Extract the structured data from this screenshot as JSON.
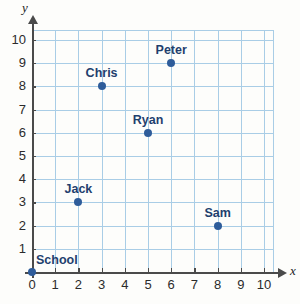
{
  "chart_data": {
    "type": "scatter",
    "title": "",
    "xlabel": "x",
    "ylabel": "y",
    "xlim": [
      0,
      10
    ],
    "ylim": [
      0,
      10
    ],
    "grid": true,
    "legend": "none",
    "x_ticks": [
      "0",
      "1",
      "2",
      "3",
      "4",
      "5",
      "6",
      "7",
      "8",
      "9",
      "10"
    ],
    "y_ticks": [
      "1",
      "2",
      "3",
      "4",
      "5",
      "6",
      "7",
      "8",
      "9",
      "10"
    ],
    "point_color": "#2e5c9a",
    "label_color": "#1f3f6e",
    "grid_color": "#a9cde6",
    "axis_color": "#4a4a4a",
    "points": [
      {
        "name": "School",
        "x": 0,
        "y": 0,
        "label_pos": "right-above"
      },
      {
        "name": "Jack",
        "x": 2,
        "y": 3,
        "label_pos": "above"
      },
      {
        "name": "Chris",
        "x": 3,
        "y": 8,
        "label_pos": "above"
      },
      {
        "name": "Ryan",
        "x": 5,
        "y": 6,
        "label_pos": "above"
      },
      {
        "name": "Peter",
        "x": 6,
        "y": 9,
        "label_pos": "above"
      },
      {
        "name": "Sam",
        "x": 8,
        "y": 2,
        "label_pos": "above"
      }
    ]
  }
}
